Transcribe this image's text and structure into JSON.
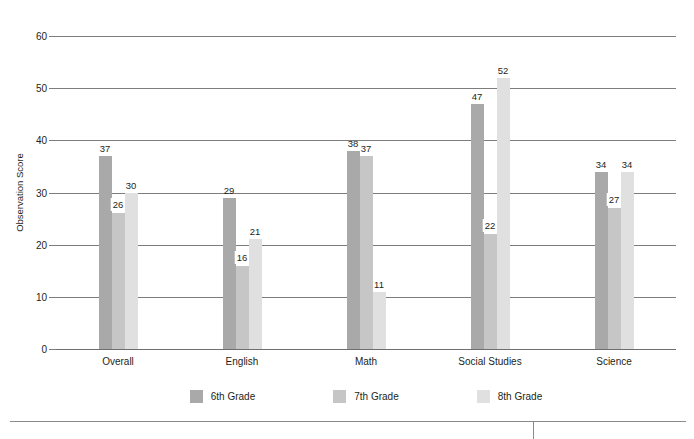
{
  "chart_data": {
    "type": "bar",
    "title": "",
    "xlabel": "",
    "ylabel": "Observation Score",
    "ylim": [
      0,
      60
    ],
    "ytick_step": 10,
    "yticks": [
      0,
      10,
      20,
      30,
      40,
      50,
      60
    ],
    "grid": true,
    "legend_position": "bottom",
    "categories": [
      "Overall",
      "English",
      "Math",
      "Social Studies",
      "Science"
    ],
    "series": [
      {
        "name": "6th Grade",
        "color": "#a9a9a9",
        "values": [
          37,
          26,
          38,
          47,
          34
        ]
      },
      {
        "name": "7th Grade",
        "color": "#c6c6c6",
        "values": [
          26,
          16,
          37,
          22,
          27
        ]
      },
      {
        "name": "8th Grade",
        "color": "#e0e0e0",
        "values": [
          30,
          21,
          11,
          52,
          34
        ]
      }
    ]
  },
  "yaxis": {
    "title": "Observation Score",
    "ticks": [
      "60",
      "50",
      "40",
      "30",
      "20",
      "10",
      "0"
    ]
  },
  "groups": [
    {
      "category": "Overall",
      "bars": [
        {
          "series": "6th Grade",
          "value": "37",
          "boxed": false
        },
        {
          "series": "7th Grade",
          "value": "26",
          "boxed": true
        },
        {
          "series": "8th Grade",
          "value": "30",
          "boxed": false
        }
      ]
    },
    {
      "category": "English",
      "bars": [
        {
          "series": "6th Grade",
          "value": "29",
          "boxed": false
        },
        {
          "series": "7th Grade",
          "value": "16",
          "boxed": true
        },
        {
          "series": "8th Grade",
          "value": "21",
          "boxed": false
        }
      ]
    },
    {
      "category": "Math",
      "bars": [
        {
          "series": "6th Grade",
          "value": "38",
          "boxed": false
        },
        {
          "series": "7th Grade",
          "value": "37",
          "boxed": false
        },
        {
          "series": "8th Grade",
          "value": "11",
          "boxed": false
        }
      ]
    },
    {
      "category": "Social Studies",
      "bars": [
        {
          "series": "6th Grade",
          "value": "47",
          "boxed": false
        },
        {
          "series": "7th Grade",
          "value": "22",
          "boxed": true
        },
        {
          "series": "8th Grade",
          "value": "52",
          "boxed": false
        }
      ]
    },
    {
      "category": "Science",
      "bars": [
        {
          "series": "6th Grade",
          "value": "34",
          "boxed": false
        },
        {
          "series": "7th Grade",
          "value": "27",
          "boxed": true
        },
        {
          "series": "8th Grade",
          "value": "34",
          "boxed": false
        }
      ]
    }
  ],
  "legend": [
    {
      "label": "6th Grade",
      "color": "#a9a9a9"
    },
    {
      "label": "7th Grade",
      "color": "#c6c6c6"
    },
    {
      "label": "8th Grade",
      "color": "#e0e0e0"
    }
  ]
}
